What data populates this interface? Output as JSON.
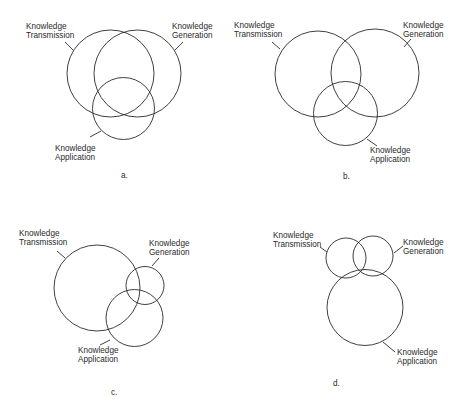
{
  "figure": {
    "panels": [
      {
        "id": "a",
        "caption": "a.",
        "labels": {
          "transmission": [
            "Knowledge",
            "Transmission"
          ],
          "generation": [
            "Knowledge",
            "Generation"
          ],
          "application": [
            "Knowledge",
            "Application"
          ]
        },
        "circles": {
          "transmission": {
            "cx": 110.5,
            "cy": 73.5,
            "r": 43.5
          },
          "generation": {
            "cx": 137.5,
            "cy": 73.5,
            "r": 43.5
          },
          "application": {
            "cx": 123.5,
            "cy": 108.5,
            "r": 31
          }
        }
      },
      {
        "id": "b",
        "caption": "b.",
        "labels": {
          "transmission": [
            "Knowledge",
            "Transmission"
          ],
          "generation": [
            "Knowledge",
            "Generation"
          ],
          "application": [
            "Knowledge",
            "Application"
          ]
        },
        "circles": {
          "transmission": {
            "cx": 318,
            "cy": 74,
            "r": 43
          },
          "generation": {
            "cx": 375,
            "cy": 73,
            "r": 44
          },
          "application": {
            "cx": 345.5,
            "cy": 113.5,
            "r": 32
          }
        }
      },
      {
        "id": "c",
        "caption": "c.",
        "labels": {
          "transmission": [
            "Knowledge",
            "Transmission"
          ],
          "generation": [
            "Knowledge",
            "Generation"
          ],
          "application": [
            "Knowledge",
            "Application"
          ]
        },
        "circles": {
          "transmission": {
            "cx": 97,
            "cy": 288,
            "r": 43
          },
          "generation": {
            "cx": 145,
            "cy": 285.5,
            "r": 19
          },
          "application": {
            "cx": 134.5,
            "cy": 318,
            "r": 28.5
          }
        }
      },
      {
        "id": "d",
        "caption": "d.",
        "labels": {
          "transmission": [
            "Knowledge",
            "Transmission"
          ],
          "generation": [
            "Knowledge",
            "Generation"
          ],
          "application": [
            "Knowledge",
            "Application"
          ]
        },
        "circles": {
          "transmission": {
            "cx": 346,
            "cy": 258,
            "r": 20
          },
          "generation": {
            "cx": 373,
            "cy": 256,
            "r": 20
          },
          "application": {
            "cx": 365,
            "cy": 307.5,
            "r": 38
          }
        }
      }
    ]
  }
}
